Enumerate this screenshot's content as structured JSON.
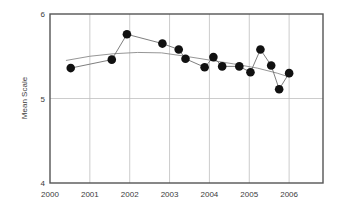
{
  "chart_data": {
    "type": "line",
    "title": "",
    "xlabel": "",
    "ylabel": "Mean Scale",
    "xlim": [
      2000,
      2006.85
    ],
    "ylim": [
      4,
      6
    ],
    "yticks": [
      "4",
      "5",
      "6"
    ],
    "ytick_values": [
      4,
      5,
      6
    ],
    "xticks": [
      "2000",
      "2001",
      "2002",
      "2003",
      "2004",
      "2005",
      "2006"
    ],
    "xtick_values": [
      2000,
      2001,
      2002,
      2003,
      2004,
      2005,
      2006
    ],
    "grid": "vertical gridlines at each year plus horizontal gridline at y=5",
    "legend": "none",
    "series": [
      {
        "name": "Mean Scale (observed)",
        "style": "line-with-round-markers",
        "color": "#111111",
        "points": [
          {
            "x": 2000.52,
            "y": 5.36
          },
          {
            "x": 2001.55,
            "y": 5.46
          },
          {
            "x": 2001.93,
            "y": 5.76
          },
          {
            "x": 2002.82,
            "y": 5.65
          },
          {
            "x": 2003.23,
            "y": 5.58
          },
          {
            "x": 2003.4,
            "y": 5.47
          },
          {
            "x": 2003.88,
            "y": 5.37
          },
          {
            "x": 2004.1,
            "y": 5.49
          },
          {
            "x": 2004.32,
            "y": 5.38
          },
          {
            "x": 2004.75,
            "y": 5.38
          },
          {
            "x": 2005.03,
            "y": 5.31
          },
          {
            "x": 2005.28,
            "y": 5.58
          },
          {
            "x": 2005.55,
            "y": 5.39
          },
          {
            "x": 2005.75,
            "y": 5.11
          },
          {
            "x": 2006.0,
            "y": 5.3
          }
        ]
      },
      {
        "name": "Trend (smoothed)",
        "style": "thin-line",
        "color": "#8a8a8a",
        "points": [
          {
            "x": 2000.4,
            "y": 5.45
          },
          {
            "x": 2001.0,
            "y": 5.5
          },
          {
            "x": 2001.6,
            "y": 5.53
          },
          {
            "x": 2002.2,
            "y": 5.545
          },
          {
            "x": 2002.8,
            "y": 5.54
          },
          {
            "x": 2003.4,
            "y": 5.5
          },
          {
            "x": 2004.0,
            "y": 5.455
          },
          {
            "x": 2004.6,
            "y": 5.41
          },
          {
            "x": 2005.2,
            "y": 5.36
          },
          {
            "x": 2005.7,
            "y": 5.3
          },
          {
            "x": 2006.0,
            "y": 5.255
          }
        ]
      }
    ]
  },
  "style": {
    "frame_color": "#555555",
    "grid_color": "#bfbfbf",
    "marker_color": "#111111",
    "trend_color": "#8a8a8a",
    "text_color": "#3b3b3b",
    "background": "#ffffff"
  }
}
